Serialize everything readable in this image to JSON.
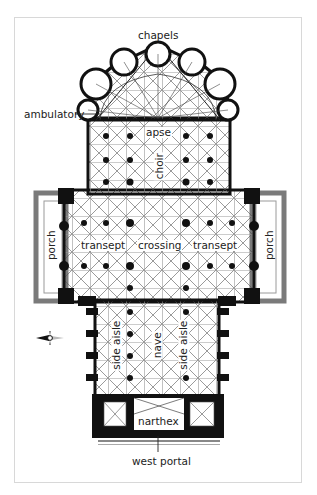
{
  "diagram": {
    "type": "architectural-floor-plan",
    "labels": {
      "chapels": "chapels",
      "ambulatory": "ambulatory",
      "apse": "apse",
      "choir": "choir",
      "transept_left": "transept",
      "crossing": "crossing",
      "transept_right": "transept",
      "porch_left": "porch",
      "porch_right": "porch",
      "side_aisle_left": "side aisle",
      "nave": "nave",
      "side_aisle_right": "side aisle",
      "narthex": "narthex",
      "west_portal": "west portal"
    },
    "compass": {
      "icon": "compass-rose-icon",
      "pointer": "west"
    },
    "colors": {
      "wall": "#111111",
      "vault_lines": "#333333",
      "porch_wall": "#7a7a7a",
      "frame": "#d8d8d8"
    }
  }
}
